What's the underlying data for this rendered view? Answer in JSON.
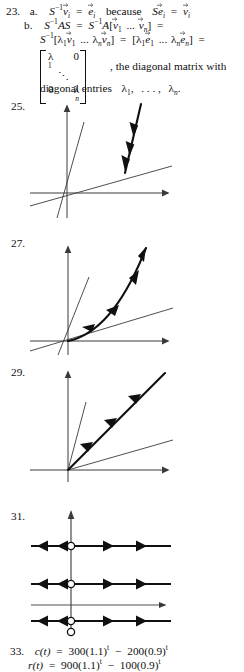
{
  "document": {
    "type": "textbook-answer-key-page",
    "width": 244,
    "height": 669
  },
  "solutions": [
    {
      "number": "23.",
      "parts": [
        {
          "label": "a.",
          "text": "S⁻¹v⃗ᵢ = e⃗ᵢ because Se⃗ᵢ = v⃗ᵢ"
        },
        {
          "label": "b.",
          "text": "S⁻¹AS = S⁻¹A[v⃗1 ... v⃗ₙ] = S⁻¹[λ1v⃗1 ... λₙv⃗ₙ] = [λ1e⃗1 ... λₙe⃗ₙ] = diag(λ1,...,λₙ), the diagonal matrix with diagonal entries λ1, ..., λₙ."
        }
      ],
      "tokens": {
        "l1_num": "23.",
        "l1_a": "a.",
        "l1_S": "S",
        "l1_Sexp": "−1",
        "l1_v": "v",
        "l1_vsub": "i",
        "l1_eq1": "=",
        "l1_e": "e",
        "l1_esub": "i",
        "l1_because": "because",
        "l1_S2": "S",
        "l1_e2": "e",
        "l1_e2sub": "i",
        "l1_eq2": "=",
        "l1_v2": "v",
        "l1_v2sub": "i",
        "l2_b": "b.",
        "l2_a": "S",
        "l2_aexp": "−1",
        "l2_AS": "AS",
        "l2_eq": "=",
        "l2_b2": "S",
        "l2_b2exp": "−1",
        "l2_A": "A",
        "l2_brk1": "[",
        "l2_v1": "v",
        "l2_v1sub": "1",
        "l2_dots": "...",
        "l2_vn": "v",
        "l2_vnsub": "n",
        "l2_brk2": "]",
        "l2_eq2": "=",
        "l3_S": "S",
        "l3_Sexp": "−1",
        "l3_brk1": "[",
        "l3_lam1": "λ",
        "l3_lam1sub": "1",
        "l3_v1": "v",
        "l3_v1sub": "1",
        "l3_dots": "...",
        "l3_lamn": "λ",
        "l3_lamnsub": "n",
        "l3_vn": "v",
        "l3_vnsub": "n",
        "l3_brk2": "]",
        "l3_eq": "=",
        "l3_brk3": "[",
        "l3_lam1b": "λ",
        "l3_lam1bsub": "1",
        "l3_e1": "e",
        "l3_e1sub": "1",
        "l3_dots2": "...",
        "l3_lamnb": "λ",
        "l3_lamnbsub": "n",
        "l3_en": "e",
        "l3_ensub": "n",
        "l3_brk4": "]",
        "l3_eq2": "=",
        "m_lam1": "λ",
        "m_lam1sub": "1",
        "m_zero_tr": "0",
        "m_ddots": "⋱",
        "m_zero_bl": "0",
        "m_lamn": "λ",
        "m_lamnsub": "n",
        "m_tail": ", the diagonal matrix with",
        "m_tail2_a": "diagonal entries",
        "m_tail2_lam1": "λ",
        "m_tail2_lam1sub": "1",
        "m_tail2_comma": ",",
        "m_tail2_dots": ". . . ,",
        "m_tail2_lamn": "λ",
        "m_tail2_lamnsub": "n",
        "m_tail2_period": "."
      }
    },
    {
      "number": "25.",
      "figure": {
        "kind": "phase-portrait",
        "description": "Two eigenlines through origin (one steep, one shallow); bold trajectory with arrowheads flowing downward toward the shallow eigenline",
        "stability": "trajectory approaches the shallow eigenline"
      }
    },
    {
      "number": "27.",
      "figure": {
        "kind": "phase-portrait",
        "description": "Two eigenlines through origin; bold curved trajectory in first quadrant with arrowheads pointing inward toward the origin",
        "stability": "trajectory tends to the origin"
      }
    },
    {
      "number": "29.",
      "figure": {
        "kind": "phase-portrait",
        "description": "Two eigenlines through origin; bold straight trajectory along a 45-degree ray with arrowheads pointing toward the origin",
        "stability": "trajectory along straight eigen-ray toward origin"
      }
    },
    {
      "number": "31.",
      "figure": {
        "kind": "phase-portrait-horizontal",
        "description": "Three bold horizontal trajectory lines with open circles on the vertical axis; arrows point away from the circles on both sides; thin x-axis between lines; extra open circle below bottom line",
        "equilibrium_marker": "open-circle",
        "lines": 3,
        "arrows_per_side": 2
      }
    },
    {
      "number": "33.",
      "equations": [
        "c(t) = 300(1.1)ᵗ − 200(0.9)ᵗ",
        "r(t) = 900(1.1)ᵗ − 100(0.9)ᵗ"
      ],
      "tokens": {
        "num": "33.",
        "c_fn": "c",
        "c_t": "(t)",
        "c_eq": "=",
        "c_a": "300(1.1)",
        "c_at": "t",
        "c_minus": "−",
        "c_b": "200(0.9)",
        "c_bt": "t",
        "r_fn": "r",
        "r_t": "(t)",
        "r_eq": "=",
        "r_a": "900(1.1)",
        "r_at": "t",
        "r_minus": "−",
        "r_b": "100(0.9)",
        "r_bt": "t"
      }
    }
  ],
  "colors": {
    "ink": "#101010",
    "thin_rule": "#3a3a3a",
    "page_background": "#ffffff"
  }
}
